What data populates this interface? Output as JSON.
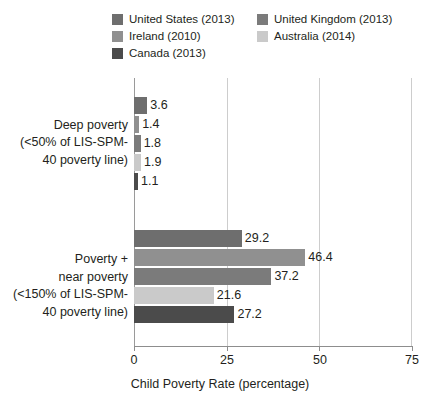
{
  "chart_data": {
    "type": "bar",
    "orientation": "horizontal",
    "title": "",
    "xlabel": "Child Poverty Rate (percentage)",
    "ylabel": "",
    "xlim": [
      0,
      75
    ],
    "xticks": [
      "0",
      "25",
      "50",
      "75"
    ],
    "xtick_values": [
      0,
      25,
      50,
      75
    ],
    "grid": "vertical",
    "legend_position": "top",
    "categories": [
      "Deep poverty (<50% of LIS-SPM-40 poverty line)",
      "Poverty + near poverty (<150% of LIS-SPM-40 poverty line)"
    ],
    "category_lines": [
      [
        "Deep poverty",
        "(<50% of LIS-SPM-",
        "40 poverty line)"
      ],
      [
        "Poverty +",
        "near poverty",
        "(<150% of LIS-SPM-",
        "40 poverty line)"
      ]
    ],
    "series": [
      {
        "name": "United States (2013)",
        "color": "#6e6e6e",
        "values": [
          3.6,
          29.2
        ],
        "labels": [
          "3.6",
          "29.2"
        ]
      },
      {
        "name": "Ireland (2010)",
        "color": "#909090",
        "values": [
          1.4,
          46.4
        ],
        "labels": [
          "1.4",
          "46.4"
        ]
      },
      {
        "name": "United Kingdom (2013)",
        "color": "#7b7b7b",
        "values": [
          1.8,
          37.2
        ],
        "labels": [
          "1.8",
          "37.2"
        ]
      },
      {
        "name": "Australia (2014)",
        "color": "#cacaca",
        "values": [
          1.9,
          21.6
        ],
        "labels": [
          "1.9",
          "21.6"
        ]
      },
      {
        "name": "Canada (2013)",
        "color": "#4b4b4b",
        "values": [
          1.1,
          27.2
        ],
        "labels": [
          "1.1",
          "27.2"
        ]
      }
    ]
  },
  "legend": {
    "columns": [
      [
        {
          "label": "United States (2013)",
          "color": "#6e6e6e"
        },
        {
          "label": "Ireland (2010)",
          "color": "#909090"
        },
        {
          "label": "Canada (2013)",
          "color": "#4b4b4b"
        }
      ],
      [
        {
          "label": "United Kingdom (2013)",
          "color": "#7b7b7b"
        },
        {
          "label": "Australia (2014)",
          "color": "#cacaca"
        }
      ]
    ]
  },
  "axis": {
    "x_title": "Child Poverty Rate (percentage)",
    "ticks": [
      "0",
      "25",
      "50",
      "75"
    ]
  }
}
